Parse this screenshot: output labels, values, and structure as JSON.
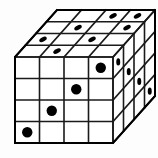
{
  "figure": {
    "type": "isometric-cube-grid",
    "grid": {
      "columns": 4,
      "rows": 4,
      "depth": 4
    },
    "colors": {
      "background": "#fdfdfd",
      "face": "#ffffff",
      "line": "#1a1a1a",
      "outline": "#000000",
      "pip": "#000000"
    },
    "geometry": {
      "front_origin": {
        "x": 15,
        "y": 57
      },
      "cell_width": 24.5,
      "cell_height": 21.5,
      "depth_step": {
        "dx": 10.5,
        "dy": -11.75
      },
      "stroke_width": 1.6,
      "outline_width": 2.0,
      "pip_radius_front": 5.2,
      "pip_radius_top": 4.1,
      "pip_radius_side": 3.6
    },
    "faces": {
      "front": {
        "name": "front-face",
        "label": "Front face",
        "rows": 4,
        "columns": 4,
        "pips": [
          {
            "row": 0,
            "col": 3
          },
          {
            "row": 1,
            "col": 2
          },
          {
            "row": 2,
            "col": 1
          },
          {
            "row": 3,
            "col": 0
          }
        ]
      },
      "top": {
        "name": "top-face",
        "label": "Top face",
        "rows": 4,
        "columns": 4,
        "pips": [
          {
            "row": 0,
            "col": 1
          },
          {
            "row": 1,
            "col": 2
          },
          {
            "row": 2,
            "col": 3
          },
          {
            "row": 1,
            "col": 0
          },
          {
            "row": 2,
            "col": 1
          },
          {
            "row": 3,
            "col": 2
          },
          {
            "row": 3,
            "col": 3
          }
        ]
      },
      "right": {
        "name": "right-face",
        "label": "Right side face",
        "rows": 4,
        "columns": 4,
        "pips": [
          {
            "row": 0,
            "col": 0
          },
          {
            "row": 1,
            "col": 1
          },
          {
            "row": 2,
            "col": 2
          },
          {
            "row": 3,
            "col": 3
          }
        ]
      }
    },
    "pip_total": 15
  }
}
